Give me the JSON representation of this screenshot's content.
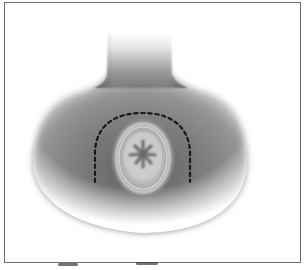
{
  "figure": {
    "type": "medical-illustration",
    "labels": [],
    "colors": {
      "background": "#ffffff",
      "frame_border": "#6a6a6a",
      "skin_dark": "#5e5e5e",
      "skin_mid": "#8a8a8a",
      "skin_light": "#cfcfcf",
      "oval_fill": "#b5b5b5",
      "oval_center": "#d6d6d6",
      "star_mark": "#6a6a6a",
      "incision_line": "#1a1a1a"
    },
    "elements": {
      "neck": {
        "x_left": 107,
        "x_right": 172,
        "top": 33
      },
      "body": {
        "x_left": 33,
        "x_right": 247,
        "bottom": 232
      },
      "oval": {
        "cx": 143,
        "cy": 158,
        "rx": 30,
        "ry": 38
      },
      "star_arms": 6,
      "incision": {
        "style": "dashed",
        "start": [
          95,
          182
        ],
        "apex_y": 113,
        "end": [
          190,
          182
        ]
      }
    }
  }
}
